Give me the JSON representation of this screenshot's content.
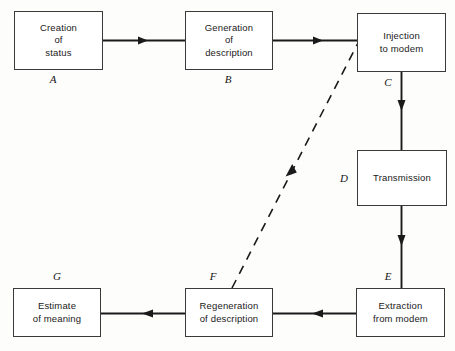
{
  "diagram": {
    "type": "flowchart",
    "background_color": "#fdfdfc",
    "line_color": "#1a1a1a",
    "box_border_color": "#3a3a3a",
    "nodes": [
      {
        "id": "A",
        "label": "A",
        "text": "Creation\nof\nstatus",
        "name": "node-creation-of-status",
        "x": 14,
        "y": 11,
        "w": 89,
        "h": 59,
        "label_x": 53,
        "label_y": 73,
        "label_anchor": "center"
      },
      {
        "id": "B",
        "label": "B",
        "text": "Generation\nof\ndescription",
        "name": "node-generation-of-description",
        "x": 185,
        "y": 11,
        "w": 88,
        "h": 59,
        "label_x": 228,
        "label_y": 73,
        "label_anchor": "center"
      },
      {
        "id": "C",
        "label": "C",
        "text": "Injection\nto  modem",
        "name": "node-injection-to-modem",
        "x": 357,
        "y": 13,
        "w": 89,
        "h": 59,
        "label_x": 388,
        "label_y": 76,
        "label_anchor": "center"
      },
      {
        "id": "D",
        "label": "D",
        "text": "Transmission",
        "name": "node-transmission",
        "x": 357,
        "y": 150,
        "w": 90,
        "h": 56,
        "label_x": 344,
        "label_y": 172,
        "label_anchor": "center"
      },
      {
        "id": "E",
        "label": "E",
        "text": "Extraction\nfrom  modem",
        "name": "node-extraction-from-modem",
        "x": 356,
        "y": 288,
        "w": 89,
        "h": 49,
        "label_x": 388,
        "label_y": 270,
        "label_anchor": "center"
      },
      {
        "id": "F",
        "label": "F",
        "text": "Regeneration\nof  description",
        "name": "node-regeneration-of-description",
        "x": 185,
        "y": 288,
        "w": 88,
        "h": 49,
        "label_x": 213,
        "label_y": 270,
        "label_anchor": "center"
      },
      {
        "id": "G",
        "label": "G",
        "text": "Estimate\nof  meaning",
        "name": "node-estimate-of-meaning",
        "x": 13,
        "y": 288,
        "w": 88,
        "h": 49,
        "label_x": 57,
        "label_y": 270,
        "label_anchor": "center"
      }
    ],
    "edges": [
      {
        "id": "a-to-b",
        "from": "A",
        "to": "B",
        "style": "solid",
        "direction": "right",
        "name": "edge-creation-to-generation"
      },
      {
        "id": "b-to-c",
        "from": "B",
        "to": "C",
        "style": "solid",
        "direction": "right",
        "name": "edge-generation-to-injection"
      },
      {
        "id": "c-to-d",
        "from": "C",
        "to": "D",
        "style": "solid",
        "direction": "down",
        "name": "edge-injection-to-transmission"
      },
      {
        "id": "d-to-e",
        "from": "D",
        "to": "E",
        "style": "solid",
        "direction": "down",
        "name": "edge-transmission-to-extraction"
      },
      {
        "id": "e-to-f",
        "from": "E",
        "to": "F",
        "style": "solid",
        "direction": "left",
        "name": "edge-extraction-to-regeneration"
      },
      {
        "id": "f-to-g",
        "from": "F",
        "to": "G",
        "style": "solid",
        "direction": "left",
        "name": "edge-regeneration-to-estimate"
      },
      {
        "id": "f-to-c",
        "from": "F",
        "to": "C",
        "style": "dashed",
        "direction": "up-right",
        "name": "edge-regeneration-to-injection-feedback"
      }
    ]
  }
}
